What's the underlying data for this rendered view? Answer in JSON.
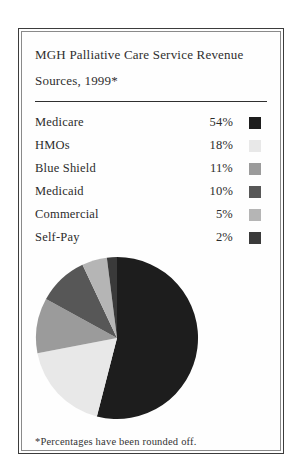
{
  "card": {
    "title_line1": "MGH Palliative Care Service Revenue",
    "title_line2": "Sources, 1999*",
    "footnote": "*Percentages have been rounded off."
  },
  "chart_data": {
    "type": "pie",
    "title": "MGH Palliative Care Service Revenue Sources, 1999*",
    "start_angle": "12 o'clock",
    "direction": "clockwise",
    "legend_position": "above",
    "footnote": "*Percentages have been rounded off.",
    "slices": [
      {
        "label": "Medicare",
        "value": 54,
        "pct_label": "54%",
        "color": "#1d1d1d"
      },
      {
        "label": "HMOs",
        "value": 18,
        "pct_label": "18%",
        "color": "#e8e8e8"
      },
      {
        "label": "Blue Shield",
        "value": 11,
        "pct_label": "11%",
        "color": "#9b9b9b"
      },
      {
        "label": "Medicaid",
        "value": 10,
        "pct_label": "10%",
        "color": "#575757"
      },
      {
        "label": "Commercial",
        "value": 5,
        "pct_label": "5%",
        "color": "#b5b5b5"
      },
      {
        "label": "Self-Pay",
        "value": 2,
        "pct_label": "2%",
        "color": "#3a3a3a"
      }
    ]
  }
}
